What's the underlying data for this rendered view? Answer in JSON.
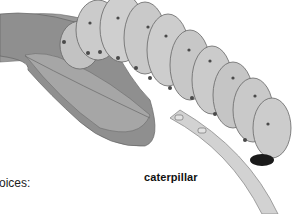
{
  "image": {
    "subject": "caterpillar on leaf illustration",
    "palette": {
      "background": "#ffffff",
      "leaf": "#8a8a8a",
      "leaf_light": "#a9a9a9",
      "body": "#c4c4c4",
      "body_light": "#d6d6d6",
      "outline": "#555555",
      "spots": "#4a4a4a",
      "stem": "#cfcfcf",
      "head_dark": "#1a1a1a"
    }
  },
  "labels": {
    "caption": "caterpillar",
    "partial_text": "oices:"
  }
}
